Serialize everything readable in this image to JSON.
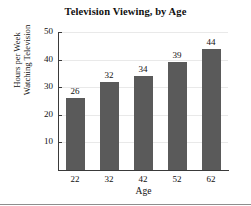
{
  "chart_data": {
    "type": "bar",
    "title": "Television Viewing, by Age",
    "xlabel": "Age",
    "ylabel_line1": "Hours per Week",
    "ylabel_line2": "Watching Television",
    "categories": [
      "22",
      "32",
      "42",
      "52",
      "62"
    ],
    "values": [
      26,
      32,
      34,
      39,
      44
    ],
    "value_labels": [
      "26",
      "32",
      "34",
      "39",
      "44"
    ],
    "yticks": [
      10,
      20,
      30,
      40,
      50
    ],
    "ytick_labels": [
      "10",
      "20",
      "30",
      "40",
      "50"
    ],
    "ylim": [
      0,
      50
    ],
    "grid": true,
    "legend": null,
    "bar_color": "#5a5a5a",
    "axis_color": "#3a3a3a",
    "grid_color": "#e9e9e9",
    "background": "#ffffff"
  }
}
